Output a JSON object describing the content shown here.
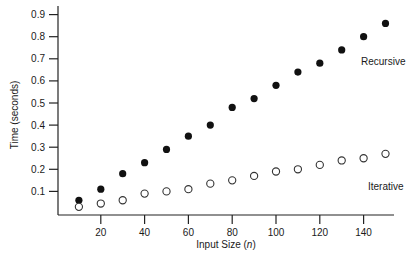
{
  "chart_data": {
    "type": "scatter",
    "title": "",
    "xlabel": "Input Size (n)",
    "xlabel_prefix": "Input Size (",
    "xlabel_var": "n",
    "xlabel_suffix": ")",
    "ylabel": "Time (seconds)",
    "xlim": [
      0,
      155
    ],
    "ylim": [
      0,
      0.95
    ],
    "x_ticks": [
      20,
      40,
      60,
      80,
      100,
      120,
      140
    ],
    "y_ticks": [
      0.1,
      0.2,
      0.3,
      0.4,
      0.5,
      0.6,
      0.7,
      0.8,
      0.9
    ],
    "grid": false,
    "legend": "inline labels",
    "x": [
      10,
      20,
      30,
      40,
      50,
      60,
      70,
      80,
      90,
      100,
      110,
      120,
      130,
      140,
      150
    ],
    "series": [
      {
        "name": "Recursive",
        "marker": "filled-circle",
        "color": "#111111",
        "values": [
          0.06,
          0.11,
          0.18,
          0.23,
          0.29,
          0.35,
          0.4,
          0.48,
          0.52,
          0.58,
          0.64,
          0.68,
          0.74,
          0.8,
          0.86
        ]
      },
      {
        "name": "Iterative",
        "marker": "open-circle",
        "color": "#333333",
        "values": [
          0.03,
          0.045,
          0.06,
          0.09,
          0.1,
          0.11,
          0.135,
          0.15,
          0.17,
          0.19,
          0.2,
          0.22,
          0.24,
          0.25,
          0.27
        ]
      }
    ],
    "annotations": [
      {
        "text": "Recursive",
        "series": "Recursive"
      },
      {
        "text": "Iterative",
        "series": "Iterative"
      }
    ]
  },
  "colors": {
    "axis": "#222222",
    "background": "#ffffff"
  }
}
